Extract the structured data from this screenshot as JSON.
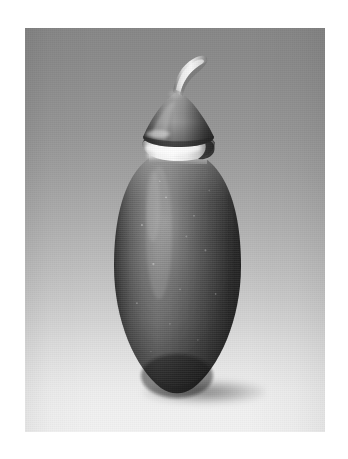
{
  "page": {
    "background_color": "#ffffff",
    "width": 348,
    "height": 459
  },
  "photo": {
    "alt": "Studio photograph of a dark ovoid ceramic vessel with a conical lid, a bright white collar band and a curved pale stem finial, set against a graduated gray backdrop",
    "frame": {
      "left": 25,
      "top": 28,
      "width": 300,
      "height": 404
    },
    "backdrop": {
      "name": "graduated studio sweep",
      "top_color": "#878787",
      "mid_color": "#b4b4b4",
      "bottom_color": "#f1f1f1",
      "direction": "vertical, dark top to light bottom"
    },
    "shadow": {
      "name": "cast shadow",
      "color": "#2e2e2e",
      "shape": "soft ellipse beneath the vessel tip"
    }
  },
  "subject": {
    "name": "ovoid lidded vessel",
    "parts": [
      {
        "id": "stem",
        "label": "curved stem finial",
        "color_light": "#efefef",
        "color_dark": "#8d8d8d",
        "description": "pale hook-shaped stem curving up and to the right from the apex of the lid"
      },
      {
        "id": "lid",
        "label": "conical lid",
        "color_light": "#9a9a9a",
        "color_dark": "#3b3b3b",
        "description": "low dome / cone shaped cover with a highlight on its left face"
      },
      {
        "id": "collar",
        "label": "white collar band",
        "color_light": "#f6f6f6",
        "color_dark": "#1a1a1a",
        "description": "bright glossy ring where the lid meets the body"
      },
      {
        "id": "body",
        "label": "ovoid body",
        "color_light": "#7d7d7d",
        "color_mid": "#5a5a5a",
        "color_dark": "#1e1e1e",
        "description": "tall dark egg-shaped body tapering to a point at the base, speckled matte surface with a soft vertical highlight left of center"
      }
    ],
    "bounds": {
      "left": 114,
      "top": 68,
      "right": 240,
      "bottom": 388
    }
  }
}
